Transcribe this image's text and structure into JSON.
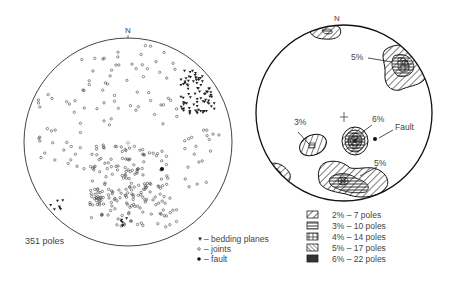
{
  "left_diagram": {
    "title": "Pole plot",
    "north_label": "N",
    "count_label": "351 poles",
    "center": [
      128,
      142
    ],
    "radius": 104,
    "legend": [
      {
        "symbol": "triangle",
        "label": "– bedding planes"
      },
      {
        "symbol": "circle",
        "label": "– joints"
      },
      {
        "symbol": "dot",
        "label": "– fault"
      }
    ]
  },
  "right_diagram": {
    "title": "Contour plot",
    "north_label": "N",
    "center": [
      344,
      113
    ],
    "radius": 88,
    "annotations": [
      {
        "text": "5%",
        "x": 351,
        "y": 60
      },
      {
        "text": "3%",
        "x": 294,
        "y": 124
      },
      {
        "text": "6%",
        "x": 372,
        "y": 123
      },
      {
        "text": "Fault",
        "x": 395,
        "y": 131
      },
      {
        "text": "5%",
        "x": 374,
        "y": 166
      }
    ],
    "legend": [
      {
        "pattern": "diag",
        "label": "2% – 7 poles"
      },
      {
        "pattern": "horiz",
        "label": "3% – 10 poles"
      },
      {
        "pattern": "grid",
        "label": "4% – 14 poles"
      },
      {
        "pattern": "diagdense",
        "label": "5% – 17 poles"
      },
      {
        "pattern": "solid",
        "label": "6% – 22 poles"
      }
    ]
  }
}
